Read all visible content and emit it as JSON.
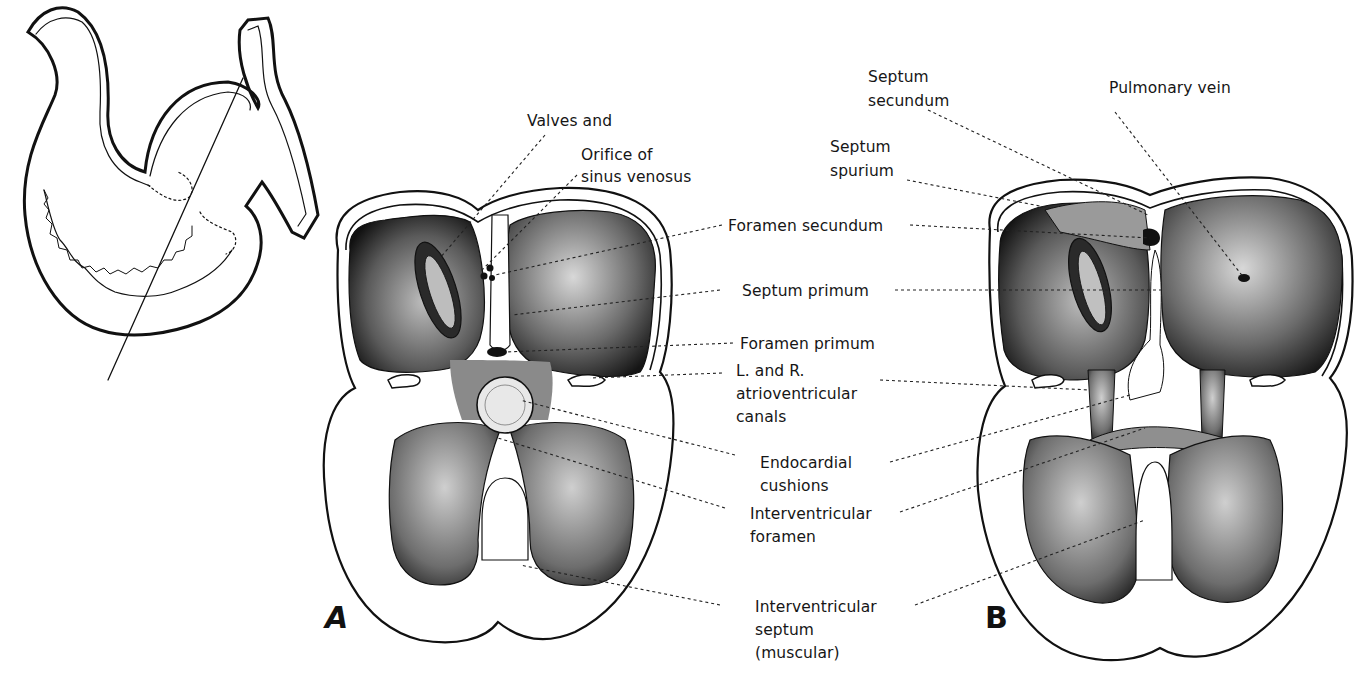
{
  "figure": {
    "inset": {
      "description": "Outline of embryonic heart tube with section plane line"
    },
    "panels": [
      {
        "id": "A",
        "letter": "A"
      },
      {
        "id": "B",
        "letter": "B"
      }
    ],
    "labels": {
      "valves_and": "Valves and",
      "orifice_of": "Orifice of",
      "sinus_venosus": "sinus venosus",
      "foramen_secundum": "Foramen secundum",
      "septum_primum": "Septum primum",
      "foramen_primum": "Foramen primum",
      "av_canals_1": "L. and R.",
      "av_canals_2": "atrioventricular",
      "av_canals_3": "canals",
      "endocardial_1": "Endocardial",
      "endocardial_2": "cushions",
      "iv_foramen_1": "Interventricular",
      "iv_foramen_2": "foramen",
      "iv_septum_1": "Interventricular",
      "iv_septum_2": "septum",
      "iv_septum_3": "(muscular)",
      "septum_secundum_1": "Septum",
      "septum_secundum_2": "secundum",
      "pulmonary_vein": "Pulmonary vein",
      "septum_spurium_1": "Septum",
      "septum_spurium_2": "spurium"
    },
    "colors": {
      "ink": "#111111",
      "background": "#ffffff"
    }
  }
}
